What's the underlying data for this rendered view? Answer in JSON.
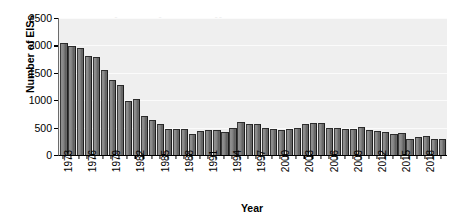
{
  "ghost_watermark": "Policy Act (NEPA)",
  "chart_data": {
    "type": "bar",
    "title": "",
    "xlabel": "Year",
    "ylabel": "Number of EISs",
    "ylim": [
      0,
      2500
    ],
    "yticks": [
      0,
      500,
      1000,
      1500,
      2000,
      2500
    ],
    "ytick_labels": [
      "0",
      "500",
      "1000",
      "1500",
      "2000",
      "2500"
    ],
    "xtick_labels": [
      "1973",
      "1976",
      "1979",
      "1982",
      "1985",
      "1988",
      "1991",
      "1994",
      "1997",
      "2000",
      "2003",
      "2006",
      "2009",
      "2012",
      "2015",
      "2018"
    ],
    "xtick_interval": 3,
    "grid": true,
    "legend": "none",
    "plot_background": "#efefef",
    "bar_color": "#7a7a7a",
    "categories": [
      "1973",
      "1974",
      "1975",
      "1976",
      "1977",
      "1978",
      "1979",
      "1980",
      "1981",
      "1982",
      "1983",
      "1984",
      "1985",
      "1986",
      "1987",
      "1988",
      "1989",
      "1990",
      "1991",
      "1992",
      "1993",
      "1994",
      "1995",
      "1996",
      "1997",
      "1998",
      "1999",
      "2000",
      "2001",
      "2002",
      "2003",
      "2004",
      "2005",
      "2006",
      "2007",
      "2008",
      "2009",
      "2010",
      "2011",
      "2012",
      "2013",
      "2014",
      "2015",
      "2016",
      "2017",
      "2018",
      "2019",
      "2020"
    ],
    "values": [
      2050,
      1990,
      1960,
      1810,
      1790,
      1560,
      1370,
      1270,
      990,
      1030,
      720,
      630,
      570,
      480,
      470,
      470,
      380,
      430,
      460,
      460,
      420,
      500,
      600,
      560,
      560,
      490,
      470,
      450,
      470,
      500,
      560,
      580,
      580,
      500,
      490,
      470,
      480,
      510,
      450,
      430,
      420,
      380,
      400,
      290,
      330,
      340,
      300,
      300
    ]
  }
}
